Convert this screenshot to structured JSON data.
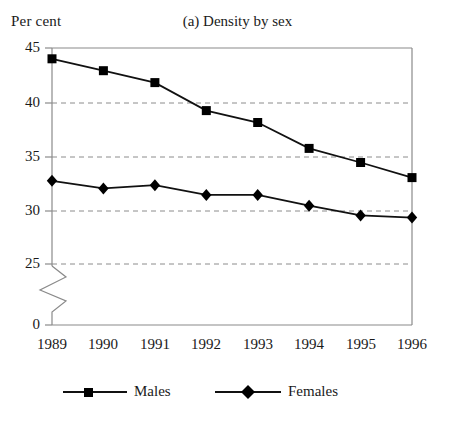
{
  "chart_data": {
    "type": "line",
    "title": "(a) Density by sex",
    "ylabel": "Per cent",
    "xlabel": "",
    "categories": [
      "1989",
      "1990",
      "1991",
      "1992",
      "1993",
      "1994",
      "1995",
      "1996"
    ],
    "series": [
      {
        "name": "Males",
        "marker": "square",
        "values": [
          44.0,
          42.9,
          41.8,
          39.2,
          38.1,
          35.7,
          34.4,
          33.0
        ]
      },
      {
        "name": "Females",
        "marker": "diamond",
        "values": [
          32.7,
          32.0,
          32.3,
          31.4,
          31.4,
          30.4,
          29.5,
          29.3
        ]
      }
    ],
    "ytick_labels": [
      "45",
      "40",
      "35",
      "30",
      "25",
      "0"
    ],
    "ytick_values": [
      45,
      40,
      35,
      30,
      25,
      0
    ],
    "ylim": [
      25,
      45
    ],
    "axis_break": true,
    "grid": "horizontal-dashed",
    "legend_position": "bottom",
    "colors": {
      "line": "#111111",
      "marker": "#000000",
      "grid": "#8c8c8c",
      "frame": "#8a8a8a",
      "text": "#1a1a1a"
    }
  },
  "legend": {
    "entries": [
      {
        "label": "Males"
      },
      {
        "label": "Females"
      }
    ]
  }
}
